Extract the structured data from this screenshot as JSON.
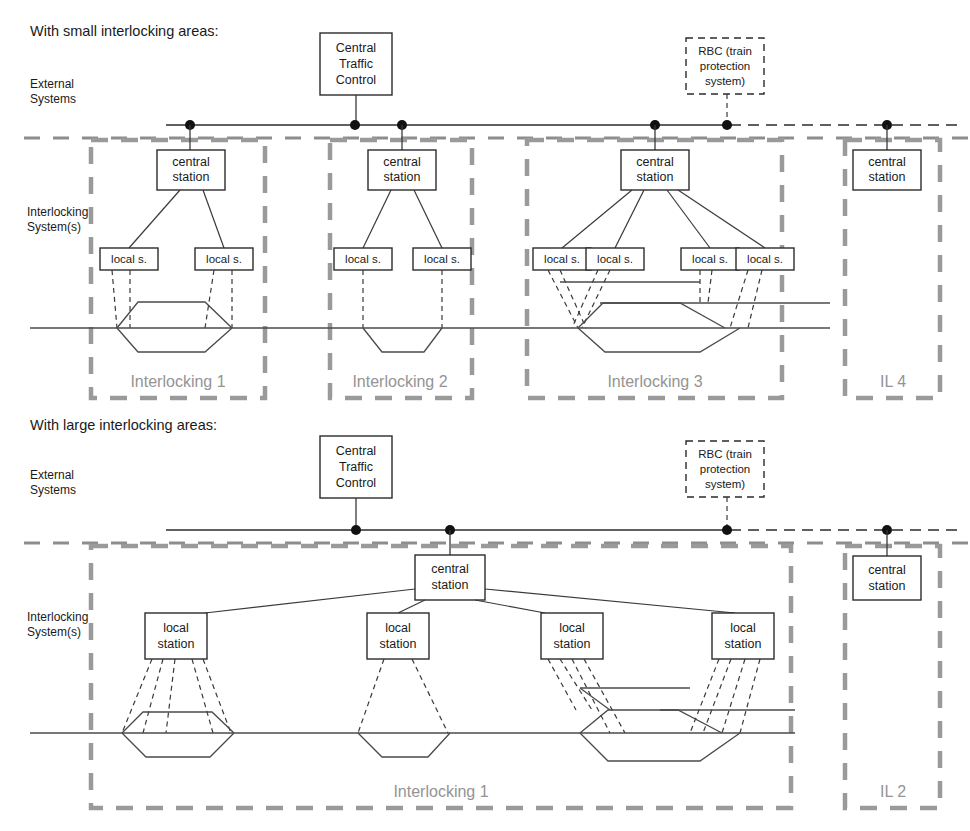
{
  "page": {
    "title_top": "With small interlocking areas:",
    "title_bottom": "With large interlocking areas:"
  },
  "labels": {
    "external_systems": "External",
    "external_systems_2": "Systems",
    "interlocking_systems": "Interlocking",
    "interlocking_systems_2": "System(s)"
  },
  "top_section": {
    "title": "With small interlocking areas:",
    "side_label_1a": "External",
    "side_label_1b": "Systems",
    "side_label_2a": "Interlocking",
    "side_label_2b": "System(s)",
    "external_nodes": [
      {
        "id": "ctc",
        "line1": "Central",
        "line2": "Traffic",
        "line3": "Control",
        "style": "solid"
      },
      {
        "id": "rbc",
        "line1": "RBC (train",
        "line2": "protection",
        "line3": "system)",
        "style": "dashed"
      }
    ],
    "zones": [
      {
        "id": "il1",
        "label": "Interlocking 1",
        "central_station": {
          "line1": "central",
          "line2": "station"
        },
        "local_stations": [
          {
            "label": "local s."
          },
          {
            "label": "local s."
          }
        ]
      },
      {
        "id": "il2",
        "label": "Interlocking 2",
        "central_station": {
          "line1": "central",
          "line2": "station"
        },
        "local_stations": [
          {
            "label": "local s."
          },
          {
            "label": "local s."
          }
        ]
      },
      {
        "id": "il3",
        "label": "Interlocking 3",
        "central_station": {
          "line1": "central",
          "line2": "station"
        },
        "local_stations": [
          {
            "label": "local s."
          },
          {
            "label": "local s."
          },
          {
            "label": "local s."
          },
          {
            "label": "local s."
          }
        ]
      },
      {
        "id": "il4",
        "label": "IL 4",
        "central_station": {
          "line1": "central",
          "line2": "station"
        },
        "local_stations": []
      }
    ]
  },
  "bottom_section": {
    "title": "With large interlocking areas:",
    "side_label_1a": "External",
    "side_label_1b": "Systems",
    "side_label_2a": "Interlocking",
    "side_label_2b": "System(s)",
    "external_nodes": [
      {
        "id": "ctc",
        "line1": "Central",
        "line2": "Traffic",
        "line3": "Control",
        "style": "solid"
      },
      {
        "id": "rbc",
        "line1": "RBC (train",
        "line2": "protection",
        "line3": "system)",
        "style": "dashed"
      }
    ],
    "zones": [
      {
        "id": "il1",
        "label": "Interlocking 1",
        "central_station": {
          "line1": "central",
          "line2": "station"
        },
        "local_stations": [
          {
            "line1": "local",
            "line2": "station"
          },
          {
            "line1": "local",
            "line2": "station"
          },
          {
            "line1": "local",
            "line2": "station"
          },
          {
            "line1": "local",
            "line2": "station"
          }
        ]
      },
      {
        "id": "il2",
        "label": "IL 2",
        "central_station": {
          "line1": "central",
          "line2": "station"
        },
        "local_stations": []
      }
    ]
  },
  "colors": {
    "zone_border": "#9a9a9a",
    "zone_label": "#949494",
    "line": "#3a3a3a",
    "bus": "#2b2b2b",
    "text": "#1a1a1a",
    "background": "#ffffff"
  }
}
